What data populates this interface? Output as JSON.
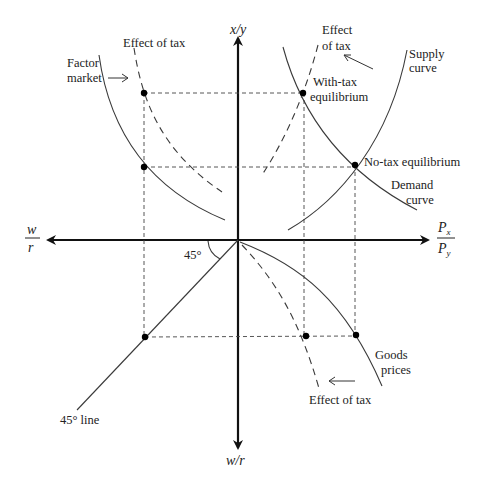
{
  "figure": {
    "type": "four-quadrant economic diagram",
    "colors": {
      "axis": "#111111",
      "curve": "#3a3a3a",
      "point": "#000000",
      "background": "#ffffff"
    }
  },
  "axes": {
    "top": "x/y",
    "bottom": "w/r",
    "left": {
      "numerator": "w",
      "denominator": "r"
    },
    "right": {
      "numerator": "P",
      "numerator_sub": "x",
      "denominator": "P",
      "denominator_sub": "y"
    }
  },
  "labels": {
    "factor_market_line1": "Factor",
    "factor_market_line2": "market",
    "effect_of_tax_top_left": "Effect of tax",
    "effect_of_tax_top_right_line1": "Effect",
    "effect_of_tax_top_right_line2": "of tax",
    "supply_curve_line1": "Supply",
    "supply_curve_line2": "curve",
    "with_tax_eq_line1": "With-tax",
    "with_tax_eq_line2": "equilibrium",
    "no_tax_eq": "No-tax equilibrium",
    "demand_curve_line1": "Demand",
    "demand_curve_line2": "curve",
    "angle": "45°",
    "line_45": "45° line",
    "goods_prices_line1": "Goods",
    "goods_prices_line2": "prices",
    "effect_of_tax_bottom": "Effect of tax"
  },
  "points": [
    {
      "name": "factor-with-tax",
      "x": 144,
      "y": 93
    },
    {
      "name": "factor-no-tax",
      "x": 144,
      "y": 167
    },
    {
      "name": "with-tax-equilibrium",
      "x": 303,
      "y": 93
    },
    {
      "name": "no-tax-equilibrium",
      "x": 355,
      "y": 165
    },
    {
      "name": "45-line-point",
      "x": 145,
      "y": 337
    },
    {
      "name": "goods-with-tax",
      "x": 306,
      "y": 336
    },
    {
      "name": "goods-no-tax",
      "x": 356,
      "y": 335
    }
  ]
}
